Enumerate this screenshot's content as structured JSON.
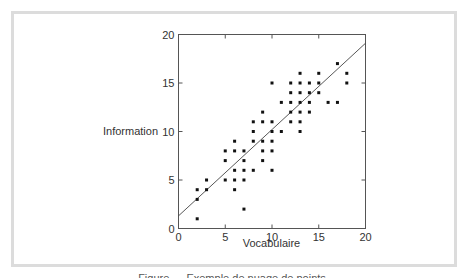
{
  "chart_data": {
    "type": "scatter",
    "title": "",
    "xlabel": "Vocabulaire",
    "ylabel": "Information",
    "xlim": [
      0,
      20
    ],
    "ylim": [
      0,
      20
    ],
    "xticks": [
      0,
      5,
      10,
      15,
      20
    ],
    "yticks": [
      0,
      5,
      10,
      15,
      20
    ],
    "grid": false,
    "legend": null,
    "points": [
      [
        2,
        4
      ],
      [
        2,
        3
      ],
      [
        2,
        1
      ],
      [
        3,
        5
      ],
      [
        3,
        4
      ],
      [
        5,
        8
      ],
      [
        5,
        7
      ],
      [
        5,
        5
      ],
      [
        6,
        9
      ],
      [
        6,
        8
      ],
      [
        6,
        6
      ],
      [
        6,
        5
      ],
      [
        6,
        4
      ],
      [
        7,
        8
      ],
      [
        7,
        7
      ],
      [
        7,
        6
      ],
      [
        7,
        5
      ],
      [
        7,
        2
      ],
      [
        8,
        11
      ],
      [
        8,
        10
      ],
      [
        8,
        9
      ],
      [
        8,
        6
      ],
      [
        9,
        12
      ],
      [
        9,
        11
      ],
      [
        9,
        9
      ],
      [
        9,
        8
      ],
      [
        9,
        7
      ],
      [
        10,
        15
      ],
      [
        10,
        11
      ],
      [
        10,
        10
      ],
      [
        10,
        9
      ],
      [
        10,
        8
      ],
      [
        10,
        6
      ],
      [
        11,
        13
      ],
      [
        11,
        10
      ],
      [
        12,
        15
      ],
      [
        12,
        14
      ],
      [
        12,
        13
      ],
      [
        12,
        12
      ],
      [
        12,
        11
      ],
      [
        13,
        16
      ],
      [
        13,
        15
      ],
      [
        13,
        14
      ],
      [
        13,
        13
      ],
      [
        13,
        12
      ],
      [
        13,
        11
      ],
      [
        13,
        10
      ],
      [
        14,
        15
      ],
      [
        14,
        14
      ],
      [
        14,
        13
      ],
      [
        14,
        12
      ],
      [
        15,
        16
      ],
      [
        15,
        15
      ],
      [
        15,
        14
      ],
      [
        16,
        13
      ],
      [
        17,
        17
      ],
      [
        17,
        13
      ],
      [
        18,
        16
      ],
      [
        18,
        15
      ]
    ],
    "regression_line": {
      "x": [
        0,
        20
      ],
      "y": [
        1.3,
        19.1
      ]
    }
  },
  "caption": "Figure — Exemple de nuage de points"
}
